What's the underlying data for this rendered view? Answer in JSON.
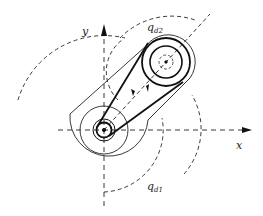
{
  "diagram": {
    "type": "two-link arm with belt-driven pulley",
    "labels": {
      "x_axis": "x",
      "y_axis": "y",
      "angle1": "q",
      "angle1_sub": "d1",
      "angle2": "q",
      "angle2_sub": "d2"
    },
    "colors": {
      "stroke": "#1a1a1a",
      "background": "#ffffff"
    }
  }
}
